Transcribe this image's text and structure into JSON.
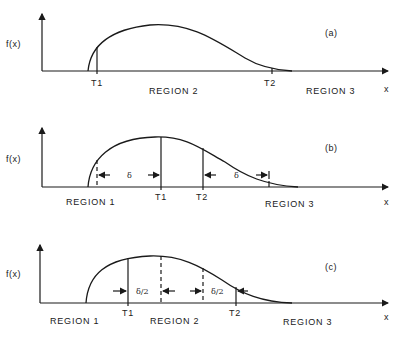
{
  "panels": [
    {
      "id": "(a)",
      "y_label": "f(x)",
      "x_label": "x",
      "thresholds": [
        "T1",
        "T2"
      ],
      "regions": [
        "REGION 2",
        "REGION 3"
      ]
    },
    {
      "id": "(b)",
      "y_label": "f(x)",
      "x_label": "x",
      "thresholds": [
        "T1",
        "T2"
      ],
      "regions": [
        "REGION 1",
        "REGION 3"
      ],
      "interval_labels": [
        "δ",
        "δ"
      ]
    },
    {
      "id": "(c)",
      "y_label": "f(x)",
      "x_label": "x",
      "thresholds": [
        "T1",
        "T2"
      ],
      "regions": [
        "REGION 1",
        "REGION 2",
        "REGION 3"
      ],
      "interval_labels": [
        "δ/2",
        "δ/2"
      ]
    }
  ]
}
